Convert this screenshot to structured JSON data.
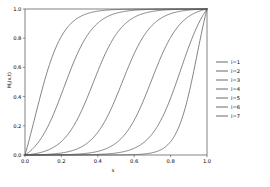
{
  "chart_data": {
    "type": "line",
    "title": "",
    "xlabel": "x",
    "ylabel": "M_i(x,t)",
    "xlim": [
      0.0,
      1.0
    ],
    "ylim": [
      0.0,
      1.0
    ],
    "grid": false,
    "legend_position": "right-outside",
    "xticks": [
      "0.0",
      "0.2",
      "0.4",
      "0.6",
      "0.8",
      "1.0"
    ],
    "xtick_values": [
      0.0,
      0.2,
      0.4,
      0.6,
      0.8,
      1.0
    ],
    "yticks": [
      "0.0",
      "0.2",
      "0.4",
      "0.6",
      "0.8",
      "1.0"
    ],
    "ytick_values": [
      0.0,
      0.2,
      0.4,
      0.6,
      0.8,
      1.0
    ],
    "x": [
      0.0,
      0.02,
      0.04,
      0.06,
      0.08,
      0.1,
      0.12,
      0.14,
      0.16,
      0.18,
      0.2,
      0.22,
      0.24,
      0.26,
      0.28,
      0.3,
      0.32,
      0.34,
      0.36,
      0.38,
      0.4,
      0.42,
      0.44,
      0.46,
      0.48,
      0.5,
      0.52,
      0.54,
      0.56,
      0.58,
      0.6,
      0.62,
      0.64,
      0.66,
      0.68,
      0.7,
      0.72,
      0.74,
      0.76,
      0.78,
      0.8,
      0.82,
      0.84,
      0.86,
      0.88,
      0.9,
      0.92,
      0.94,
      0.96,
      0.98,
      1.0
    ],
    "series": [
      {
        "name": "i=1",
        "color": "#5a5a5a",
        "center": 0.055,
        "width": 0.075,
        "values": [
          0.0,
          0.135,
          0.333,
          0.574,
          0.779,
          0.903,
          0.963,
          0.987,
          0.996,
          0.999,
          1.0,
          1.0,
          1.0,
          1.0,
          1.0,
          1.0,
          1.0,
          1.0,
          1.0,
          1.0,
          1.0,
          1.0,
          1.0,
          1.0,
          1.0,
          1.0,
          1.0,
          1.0,
          1.0,
          1.0,
          1.0,
          1.0,
          1.0,
          1.0,
          1.0,
          1.0,
          1.0,
          1.0,
          1.0,
          1.0,
          1.0,
          1.0,
          1.0,
          1.0,
          1.0,
          1.0,
          1.0,
          1.0,
          1.0,
          1.0,
          1.0
        ]
      },
      {
        "name": "i=2",
        "color": "#5a5a5a",
        "center": 0.215,
        "width": 0.08,
        "values": [
          0.0,
          0.0,
          0.001,
          0.002,
          0.005,
          0.012,
          0.028,
          0.062,
          0.129,
          0.247,
          0.416,
          0.605,
          0.768,
          0.879,
          0.943,
          0.975,
          0.99,
          0.996,
          0.999,
          1.0,
          1.0,
          1.0,
          1.0,
          1.0,
          1.0,
          1.0,
          1.0,
          1.0,
          1.0,
          1.0,
          1.0,
          1.0,
          1.0,
          1.0,
          1.0,
          1.0,
          1.0,
          1.0,
          1.0,
          1.0,
          1.0,
          1.0,
          1.0,
          1.0,
          1.0,
          1.0,
          1.0,
          1.0,
          1.0,
          1.0,
          1.0
        ]
      },
      {
        "name": "i=3",
        "color": "#5a5a5a",
        "center": 0.375,
        "width": 0.08,
        "values": [
          0.0,
          0.0,
          0.0,
          0.0,
          0.0,
          0.0,
          0.0,
          0.0,
          0.001,
          0.002,
          0.004,
          0.009,
          0.02,
          0.045,
          0.095,
          0.189,
          0.334,
          0.512,
          0.684,
          0.815,
          0.901,
          0.951,
          0.977,
          0.99,
          0.996,
          0.998,
          0.999,
          1.0,
          1.0,
          1.0,
          1.0,
          1.0,
          1.0,
          1.0,
          1.0,
          1.0,
          1.0,
          1.0,
          1.0,
          1.0,
          1.0,
          1.0,
          1.0,
          1.0,
          1.0,
          1.0,
          1.0,
          1.0,
          1.0,
          1.0,
          1.0
        ]
      },
      {
        "name": "i=4",
        "color": "#5a5a5a",
        "center": 0.535,
        "width": 0.08,
        "values": [
          0.0,
          0.0,
          0.0,
          0.0,
          0.0,
          0.0,
          0.0,
          0.0,
          0.0,
          0.0,
          0.0,
          0.0,
          0.0,
          0.0,
          0.0,
          0.001,
          0.002,
          0.004,
          0.009,
          0.019,
          0.041,
          0.086,
          0.171,
          0.307,
          0.482,
          0.656,
          0.794,
          0.884,
          0.938,
          0.968,
          0.984,
          0.992,
          0.996,
          0.998,
          0.999,
          1.0,
          1.0,
          1.0,
          1.0,
          1.0,
          1.0,
          1.0,
          1.0,
          1.0,
          1.0,
          1.0,
          1.0,
          1.0,
          1.0,
          1.0,
          1.0
        ]
      },
      {
        "name": "i=5",
        "color": "#5a5a5a",
        "center": 0.695,
        "width": 0.08,
        "values": [
          0.0,
          0.0,
          0.0,
          0.0,
          0.0,
          0.0,
          0.0,
          0.0,
          0.0,
          0.0,
          0.0,
          0.0,
          0.0,
          0.0,
          0.0,
          0.0,
          0.0,
          0.0,
          0.0,
          0.0,
          0.0,
          0.0,
          0.0,
          0.001,
          0.002,
          0.004,
          0.009,
          0.02,
          0.043,
          0.091,
          0.181,
          0.322,
          0.5,
          0.673,
          0.807,
          0.894,
          0.945,
          0.973,
          0.987,
          0.994,
          0.997,
          0.999,
          1.0,
          1.0,
          1.0,
          1.0,
          1.0,
          1.0,
          1.0,
          1.0,
          1.0
        ]
      },
      {
        "name": "i=6",
        "color": "#5a5a5a",
        "center": 0.855,
        "width": 0.08,
        "values": [
          0.0,
          0.0,
          0.0,
          0.0,
          0.0,
          0.0,
          0.0,
          0.0,
          0.0,
          0.0,
          0.0,
          0.0,
          0.0,
          0.0,
          0.0,
          0.0,
          0.0,
          0.0,
          0.0,
          0.0,
          0.0,
          0.0,
          0.0,
          0.0,
          0.0,
          0.0,
          0.0,
          0.0,
          0.0,
          0.0,
          0.001,
          0.002,
          0.004,
          0.009,
          0.02,
          0.043,
          0.091,
          0.182,
          0.325,
          0.503,
          0.676,
          0.81,
          0.896,
          0.946,
          0.974,
          0.988,
          0.994,
          0.998,
          0.999,
          1.0,
          1.0
        ]
      },
      {
        "name": "i=7",
        "color": "#5a5a5a",
        "center": 0.945,
        "width": 0.055,
        "values": [
          0.0,
          0.0,
          0.0,
          0.0,
          0.0,
          0.0,
          0.0,
          0.0,
          0.0,
          0.0,
          0.0,
          0.0,
          0.0,
          0.0,
          0.0,
          0.0,
          0.0,
          0.0,
          0.0,
          0.0,
          0.0,
          0.0,
          0.0,
          0.0,
          0.0,
          0.0,
          0.0,
          0.0,
          0.0,
          0.0,
          0.0,
          0.0,
          0.0,
          0.0,
          0.0,
          0.0,
          0.0,
          0.001,
          0.003,
          0.008,
          0.022,
          0.057,
          0.139,
          0.295,
          0.509,
          0.718,
          0.863,
          0.942,
          0.978,
          0.993,
          0.998
        ]
      }
    ]
  },
  "legend": {
    "entries": [
      {
        "label": "i=1"
      },
      {
        "label": "i=2"
      },
      {
        "label": "i=3"
      },
      {
        "label": "i=4"
      },
      {
        "label": "i=5"
      },
      {
        "label": "i=6"
      },
      {
        "label": "i=7"
      }
    ]
  }
}
